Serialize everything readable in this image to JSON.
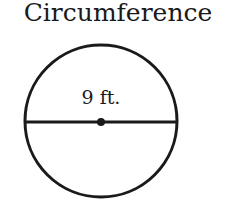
{
  "title": "Circumference",
  "figure": {
    "shape": "circle",
    "diameter_label": "9 ft.",
    "colors": {
      "stroke": "#1a1a1a",
      "background": "#ffffff"
    }
  }
}
